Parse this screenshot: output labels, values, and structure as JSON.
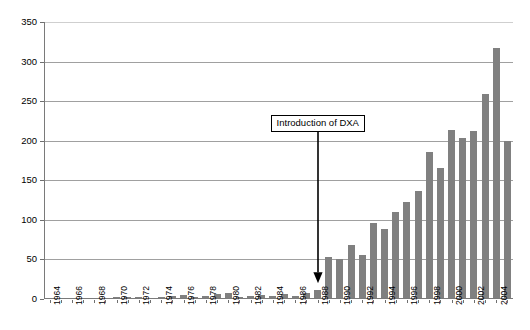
{
  "chart_data": {
    "type": "bar",
    "title": "",
    "subtitle": "",
    "xlabel": "",
    "ylabel": "",
    "ylim": [
      0,
      350
    ],
    "ytick_labels": [
      "0",
      "50",
      "100",
      "150",
      "200",
      "250",
      "300",
      "350"
    ],
    "ytick_values": [
      0,
      50,
      100,
      150,
      200,
      250,
      300,
      350
    ],
    "grid": "horizontal",
    "legend": "none",
    "bar_color": "#808080",
    "categories": [
      "1964",
      "1965",
      "1966",
      "1967",
      "1968",
      "1969",
      "1970",
      "1971",
      "1972",
      "1973",
      "1974",
      "1975",
      "1976",
      "1977",
      "1978",
      "1979",
      "1980",
      "1981",
      "1982",
      "1983",
      "1984",
      "1985",
      "1986",
      "1987",
      "1988",
      "1989",
      "1990",
      "1991",
      "1992",
      "1993",
      "1994",
      "1995",
      "1996",
      "1997",
      "1998",
      "1999",
      "2000",
      "2001",
      "2002",
      "2003",
      "2004",
      "2005"
    ],
    "xtick_labels": [
      "1964",
      "1966",
      "1968",
      "1970",
      "1972",
      "1974",
      "1976",
      "1978",
      "1980",
      "1982",
      "1984",
      "1986",
      "1988",
      "1990",
      "1992",
      "1994",
      "1996",
      "1998",
      "2000",
      "2002",
      "2004"
    ],
    "values": [
      0,
      0,
      0,
      0,
      1,
      1,
      2,
      3,
      3,
      1,
      2,
      4,
      5,
      2,
      4,
      6,
      7,
      2,
      4,
      5,
      4,
      6,
      4,
      8,
      11,
      53,
      51,
      68,
      55,
      96,
      89,
      110,
      122,
      137,
      186,
      165,
      213,
      204,
      212,
      259,
      317,
      200
    ],
    "annotations": [
      {
        "text": "Introduction of DXA",
        "points_to_category": "1988",
        "points_to_value": 20,
        "arrow": "down"
      }
    ]
  }
}
